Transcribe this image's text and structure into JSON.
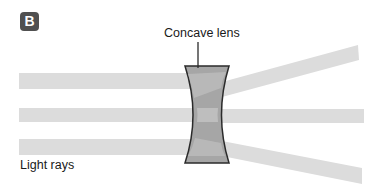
{
  "panel_label": "B",
  "labels": {
    "lens": "Concave lens",
    "rays": "Light rays"
  },
  "colors": {
    "ray": "#dcdcdc",
    "lens_fill": "#a8a8a8",
    "lens_dark": "#8c8c8c",
    "lens_outline": "#2b2b2b",
    "badge": "#505050"
  }
}
